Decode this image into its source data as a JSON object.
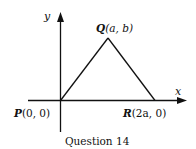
{
  "diagram": {
    "axes": {
      "x_label": "x",
      "y_label": "y"
    },
    "points": [
      {
        "name": "P",
        "label": "P(0, 0)",
        "coords": "(0, 0)"
      },
      {
        "name": "Q",
        "label": "Q(a, b)",
        "coords": "(a, b)"
      },
      {
        "name": "R",
        "label": "R(2a, 0)",
        "coords": "(2a, 0)"
      }
    ],
    "labels": {
      "P_letter": "P",
      "P_coords": "(0, 0)",
      "Q_letter": "Q",
      "Q_coords": "(a, b)",
      "R_letter": "R",
      "R_coords": "(2a, 0)"
    },
    "caption": "Question 14",
    "colors": {
      "stroke": "#111111",
      "background": "#ffffff"
    }
  }
}
